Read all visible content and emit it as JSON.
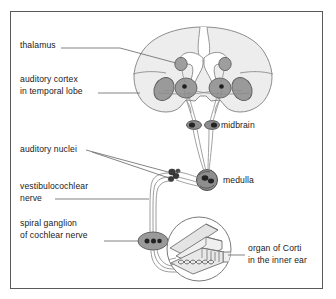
{
  "figure": {
    "background_color": "#ffffff",
    "frame_color": "#5a5a5a"
  },
  "colors": {
    "brain_fill": "#ededed",
    "brain_outline": "#8c8c8c",
    "nucleus_fill": "#9a9a9a",
    "nucleus_outline": "#555555",
    "dot_fill": "#2b2b2b",
    "nerve_line": "#7c7c7c",
    "leader_line": "#6e6e6e",
    "text": "#1a1a1a",
    "cochlea_fill": "#dcdcdc",
    "cochlea_outline": "#7a7a7a"
  },
  "labels": [
    {
      "id": "thalamus",
      "text": "thalamus",
      "align": "left",
      "x": 20,
      "y": 44,
      "lines": [
        "thalamus"
      ]
    },
    {
      "id": "auditory-cortex",
      "text": "auditory cortex in temporal lobe",
      "align": "left",
      "x": 20,
      "y": 79,
      "lines": [
        "auditory cortex",
        "in temporal lobe"
      ]
    },
    {
      "id": "auditory-nuclei",
      "text": "auditory nuclei",
      "align": "left",
      "x": 20,
      "y": 147,
      "lines": [
        "auditory nuclei"
      ]
    },
    {
      "id": "vestibulocochlear-nerve",
      "text": "vestibulocochlear nerve",
      "align": "left",
      "x": 20,
      "y": 186,
      "lines": [
        "vestibulocochlear",
        "nerve"
      ]
    },
    {
      "id": "spiral-ganglion",
      "text": "spiral ganglion of cochlear nerve",
      "align": "left",
      "x": 20,
      "y": 223,
      "lines": [
        "spiral ganglion",
        "of cochlear nerve"
      ]
    },
    {
      "id": "midbrain",
      "text": "midbrain",
      "align": "left",
      "x": 221,
      "y": 119,
      "lines": [
        "midbrain"
      ]
    },
    {
      "id": "medulla",
      "text": "medulla",
      "align": "left",
      "x": 223,
      "y": 177,
      "lines": [
        "medulla"
      ]
    },
    {
      "id": "organ-of-corti",
      "text": "organ of Corti in the inner ear",
      "align": "left",
      "x": 248,
      "y": 243,
      "lines": [
        "organ of Corti",
        "in the inner ear"
      ]
    }
  ],
  "structures": [
    {
      "id": "cerebrum",
      "name": "cerebral hemispheres (coronal section)"
    },
    {
      "id": "thalamus-nuclei",
      "name": "medial geniculate nuclei",
      "count": 2
    },
    {
      "id": "cortex-patches",
      "name": "auditory cortex patches",
      "count": 2
    },
    {
      "id": "midbrain-nuclei",
      "name": "inferior colliculi",
      "count": 2
    },
    {
      "id": "medulla-nucleus",
      "name": "medulla (superior olivary / cochlear nuclei)",
      "count": 1
    },
    {
      "id": "auditory-nuclei-cluster",
      "name": "cochlear nuclei cluster",
      "count": 1
    },
    {
      "id": "spiral-ganglion-body",
      "name": "spiral ganglion of cochlear nerve",
      "dots": 3
    },
    {
      "id": "cochlea",
      "name": "organ of Corti in the inner ear"
    }
  ]
}
